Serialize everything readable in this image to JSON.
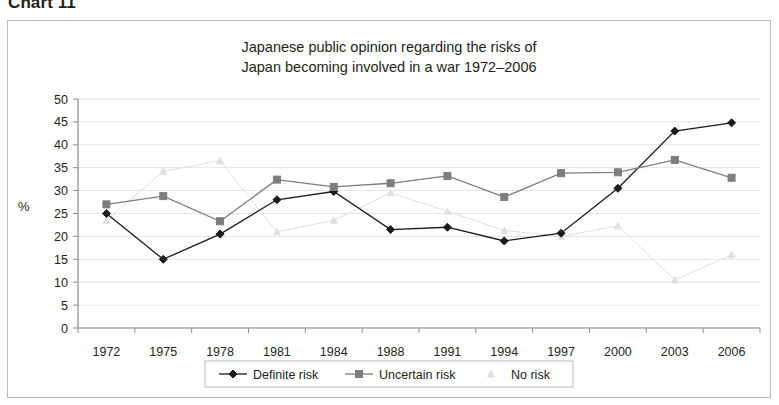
{
  "figure": {
    "caption": "Chart 11"
  },
  "chart_data": {
    "type": "line",
    "title": "Japanese public opinion regarding the risks of\nJapan becoming involved in a war 1972–2006",
    "title_line1": "Japanese public opinion regarding the risks of",
    "title_line2": "Japan becoming involved in a war 1972–2006",
    "xlabel": "",
    "ylabel": "%",
    "ylim": [
      0,
      50
    ],
    "ytick_step": 5,
    "yticks": [
      0,
      5,
      10,
      15,
      20,
      25,
      30,
      35,
      40,
      45,
      50
    ],
    "grid": true,
    "legend_position": "bottom",
    "categories": [
      "1972",
      "1975",
      "1978",
      "1981",
      "1984",
      "1988",
      "1991",
      "1994",
      "1997",
      "2000",
      "2003",
      "2006"
    ],
    "series": [
      {
        "name": "Definite risk",
        "marker": "diamond",
        "color": "#1a1a1a",
        "values": [
          25.0,
          15.0,
          20.5,
          28.0,
          29.8,
          21.5,
          22.0,
          19.0,
          20.7,
          30.5,
          43.0,
          44.8
        ]
      },
      {
        "name": "Uncertain risk",
        "marker": "square",
        "color": "#7d7d7d",
        "values": [
          27.0,
          28.8,
          23.3,
          32.4,
          30.8,
          31.6,
          33.2,
          28.6,
          33.8,
          34.0,
          36.7,
          32.8
        ]
      },
      {
        "name": "No risk",
        "marker": "triangle",
        "color": "#e0e0e0",
        "values": [
          23.5,
          34.2,
          36.5,
          21.0,
          23.5,
          29.5,
          25.5,
          21.3,
          20.0,
          22.3,
          10.5,
          16.0
        ]
      }
    ]
  }
}
